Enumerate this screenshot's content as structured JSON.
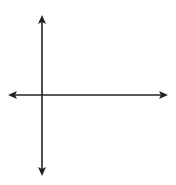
{
  "diagram": {
    "type": "coordinate-plane",
    "grid": {
      "x_min": -2,
      "x_max": 8,
      "y_min": -5,
      "y_max": 5,
      "unit": 1
    },
    "axes": {
      "x_label": "x",
      "y_label": "y",
      "origin_label": "O"
    },
    "points": [
      {
        "label": "A",
        "x": 2,
        "y": 0
      },
      {
        "label": "B",
        "x": 4,
        "y": -4
      },
      {
        "label": "C",
        "x": 6,
        "y": 0
      }
    ],
    "segments": [
      [
        "A",
        "B"
      ],
      [
        "B",
        "C"
      ],
      [
        "A",
        "C"
      ]
    ],
    "colors": {
      "grid": "#c8c8c8",
      "axis": "#222222",
      "figure": "#707070",
      "point": "#6e6e6e"
    }
  }
}
